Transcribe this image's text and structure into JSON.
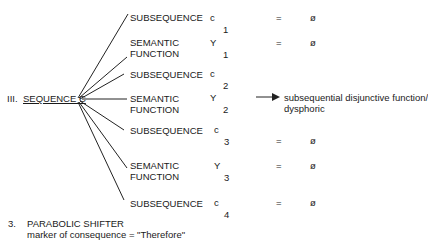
{
  "diagram": {
    "roman": "III.",
    "root": "SEQUENCE C",
    "branches": [
      {
        "label_lines": [
          "SUBSEQUENCE"
        ],
        "symbol": "c",
        "index": "1",
        "eq": "=",
        "value": "ø"
      },
      {
        "label_lines": [
          "SEMANTIC",
          "FUNCTION"
        ],
        "symbol": "Y",
        "index": "1",
        "eq": "=",
        "value": "ø"
      },
      {
        "label_lines": [
          "SUBSEQUENCE"
        ],
        "symbol": "c",
        "index": "2",
        "eq": "",
        "value": ""
      },
      {
        "label_lines": [
          "SEMANTIC",
          "FUNCTION"
        ],
        "symbol": "Y",
        "index": "2",
        "eq": "",
        "value": ""
      },
      {
        "label_lines": [
          "SUBSEQUENCE"
        ],
        "symbol": "c",
        "index": "3",
        "eq": "=",
        "value": "ø"
      },
      {
        "label_lines": [
          "SEMANTIC",
          "FUNCTION"
        ],
        "symbol": "Y",
        "index": "3",
        "eq": "=",
        "value": "ø"
      },
      {
        "label_lines": [
          "SUBSEQUENCE"
        ],
        "symbol": "c",
        "index": "4",
        "eq": "=",
        "value": "ø"
      }
    ],
    "arrow_target_lines": [
      "subsequential disjunctive function/",
      "dysphoric"
    ]
  },
  "footer": {
    "number": "3.",
    "title": "PARABOLIC SHIFTER",
    "subtitle": "marker of consequence = \"Therefore\""
  }
}
